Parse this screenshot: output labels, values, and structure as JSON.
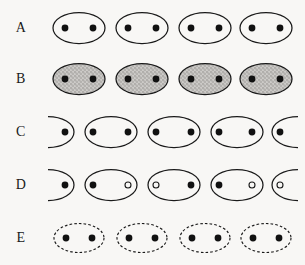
{
  "figure": {
    "background_color": "#f8f7f5",
    "stroke_color": "#1a1a1a",
    "dot_fill_color": "#111111",
    "open_dot_fill_color": "#f8f7f5",
    "shaded_fill_color": "#c2c0bd",
    "width": 305,
    "height": 265
  },
  "rows": [
    {
      "label": "A",
      "label_name": "row-label-a",
      "y": 2,
      "outline": "solid",
      "fill": "none",
      "offset": 0,
      "description": "four solid open ellipses each containing two filled dots",
      "cells": [
        {
          "shape": "ellipse",
          "cx": 79,
          "rx": 26,
          "ry": 15.5,
          "dots": [
            {
              "x": 65,
              "type": "filled"
            },
            {
              "x": 93,
              "type": "filled"
            }
          ]
        },
        {
          "shape": "ellipse",
          "cx": 142,
          "rx": 26,
          "ry": 15.5,
          "dots": [
            {
              "x": 128,
              "type": "filled"
            },
            {
              "x": 156,
              "type": "filled"
            }
          ]
        },
        {
          "shape": "ellipse",
          "cx": 205,
          "rx": 26,
          "ry": 15.5,
          "dots": [
            {
              "x": 191,
              "type": "filled"
            },
            {
              "x": 219,
              "type": "filled"
            }
          ]
        },
        {
          "shape": "ellipse",
          "cx": 266,
          "rx": 26,
          "ry": 15.5,
          "dots": [
            {
              "x": 252,
              "type": "filled"
            },
            {
              "x": 280,
              "type": "filled"
            }
          ]
        }
      ]
    },
    {
      "label": "B",
      "label_name": "row-label-b",
      "y": 53,
      "outline": "solid",
      "fill": "stippled-gray",
      "offset": 0,
      "description": "four solid ellipses with gray stippled fill each containing two filled dots",
      "cells": [
        {
          "shape": "ellipse",
          "cx": 79,
          "rx": 26,
          "ry": 15.5,
          "dots": [
            {
              "x": 65,
              "type": "filled"
            },
            {
              "x": 93,
              "type": "filled"
            }
          ]
        },
        {
          "shape": "ellipse",
          "cx": 142,
          "rx": 26,
          "ry": 15.5,
          "dots": [
            {
              "x": 128,
              "type": "filled"
            },
            {
              "x": 156,
              "type": "filled"
            }
          ]
        },
        {
          "shape": "ellipse",
          "cx": 205,
          "rx": 26,
          "ry": 15.5,
          "dots": [
            {
              "x": 191,
              "type": "filled"
            },
            {
              "x": 219,
              "type": "filled"
            }
          ]
        },
        {
          "shape": "ellipse",
          "cx": 266,
          "rx": 26,
          "ry": 15.5,
          "dots": [
            {
              "x": 252,
              "type": "filled"
            },
            {
              "x": 280,
              "type": "filled"
            }
          ]
        }
      ]
    },
    {
      "label": "C",
      "label_name": "row-label-c",
      "y": 106,
      "outline": "solid",
      "fill": "none",
      "offset": 1,
      "description": "ellipses shifted by half a period so partial ellipses appear at both ends, each containing two filled dots",
      "cells": [
        {
          "shape": "ellipse-right-half",
          "cx": 48,
          "rx": 26,
          "ry": 15.5,
          "dots": [
            {
              "x": 65,
              "type": "filled"
            }
          ]
        },
        {
          "shape": "ellipse",
          "cx": 111,
          "rx": 26,
          "ry": 15.5,
          "dots": [
            {
              "x": 93,
              "type": "filled"
            },
            {
              "x": 128,
              "type": "filled"
            }
          ]
        },
        {
          "shape": "ellipse",
          "cx": 174,
          "rx": 26,
          "ry": 15.5,
          "dots": [
            {
              "x": 156,
              "type": "filled"
            },
            {
              "x": 191,
              "type": "filled"
            }
          ]
        },
        {
          "shape": "ellipse",
          "cx": 237,
          "rx": 26,
          "ry": 15.5,
          "dots": [
            {
              "x": 219,
              "type": "filled"
            },
            {
              "x": 252,
              "type": "filled"
            }
          ]
        },
        {
          "shape": "ellipse-left-half",
          "cx": 298,
          "rx": 26,
          "ry": 15.5,
          "dots": [
            {
              "x": 280,
              "type": "filled"
            }
          ]
        }
      ]
    },
    {
      "label": "D",
      "label_name": "row-label-d",
      "y": 159,
      "outline": "solid",
      "fill": "none",
      "offset": 1,
      "description": "shifted ellipses containing alternating filled and open dots",
      "cells": [
        {
          "shape": "ellipse-right-half",
          "cx": 48,
          "rx": 26,
          "ry": 15.5,
          "dots": [
            {
              "x": 65,
              "type": "filled"
            }
          ]
        },
        {
          "shape": "ellipse",
          "cx": 111,
          "rx": 26,
          "ry": 15.5,
          "dots": [
            {
              "x": 93,
              "type": "filled"
            },
            {
              "x": 128,
              "type": "open"
            }
          ]
        },
        {
          "shape": "ellipse",
          "cx": 174,
          "rx": 26,
          "ry": 15.5,
          "dots": [
            {
              "x": 156,
              "type": "open"
            },
            {
              "x": 191,
              "type": "filled"
            }
          ]
        },
        {
          "shape": "ellipse",
          "cx": 237,
          "rx": 26,
          "ry": 15.5,
          "dots": [
            {
              "x": 219,
              "type": "filled"
            },
            {
              "x": 252,
              "type": "open"
            }
          ]
        },
        {
          "shape": "ellipse-left-half",
          "cx": 298,
          "rx": 26,
          "ry": 15.5,
          "dots": [
            {
              "x": 280,
              "type": "open"
            }
          ]
        }
      ]
    },
    {
      "label": "E",
      "label_name": "row-label-e",
      "y": 212,
      "outline": "dashed",
      "fill": "none",
      "offset": 0,
      "description": "four dashed-outline ellipses each containing two filled dots",
      "cells": [
        {
          "shape": "ellipse",
          "cx": 79,
          "rx": 25,
          "ry": 14.5,
          "dots": [
            {
              "x": 66,
              "type": "filled"
            },
            {
              "x": 92,
              "type": "filled"
            }
          ]
        },
        {
          "shape": "ellipse",
          "cx": 142,
          "rx": 25,
          "ry": 14.5,
          "dots": [
            {
              "x": 129,
              "type": "filled"
            },
            {
              "x": 155,
              "type": "filled"
            }
          ]
        },
        {
          "shape": "ellipse",
          "cx": 205,
          "rx": 25,
          "ry": 14.5,
          "dots": [
            {
              "x": 192,
              "type": "filled"
            },
            {
              "x": 218,
              "type": "filled"
            }
          ]
        },
        {
          "shape": "ellipse",
          "cx": 266,
          "rx": 25,
          "ry": 14.5,
          "dots": [
            {
              "x": 253,
              "type": "filled"
            },
            {
              "x": 279,
              "type": "filled"
            }
          ]
        }
      ]
    }
  ]
}
